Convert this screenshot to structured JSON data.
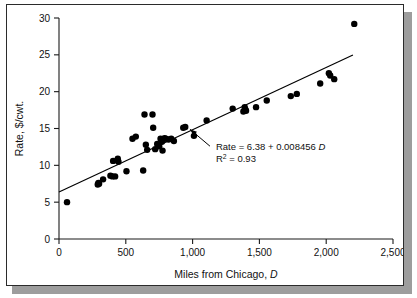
{
  "figure": {
    "caption_present": false,
    "background_color": "#ffffff",
    "border_color": "#2b2b2b",
    "shadow_color": "#9d9d9d"
  },
  "chart_data": {
    "type": "scatter",
    "title": "",
    "xlabel": "Miles from Chicago, D",
    "xlabel_plain": "Miles from Chicago,",
    "xlabel_symbol": "D",
    "ylabel": "Rate, $/cwt.",
    "xlim": [
      0,
      2500
    ],
    "ylim": [
      0,
      30
    ],
    "xticks": [
      0,
      500,
      1000,
      1500,
      2000,
      2500
    ],
    "xticklabels": [
      "0",
      "500",
      "1,000",
      "1,500",
      "2,000",
      "2,500"
    ],
    "yticks": [
      0,
      5,
      10,
      15,
      20,
      25,
      30
    ],
    "yticklabels": [
      "0",
      "5",
      "10",
      "15",
      "20",
      "25",
      "30"
    ],
    "grid": false,
    "legend": null,
    "marker_color": "#000000",
    "marker_size": 3.2,
    "series": [
      {
        "name": "Freight rate observations",
        "points": [
          [
            60,
            5.0
          ],
          [
            290,
            7.4
          ],
          [
            295,
            7.6
          ],
          [
            300,
            7.5
          ],
          [
            330,
            8.1
          ],
          [
            385,
            8.6
          ],
          [
            400,
            8.5
          ],
          [
            405,
            10.6
          ],
          [
            420,
            8.5
          ],
          [
            440,
            10.9
          ],
          [
            445,
            10.5
          ],
          [
            505,
            9.2
          ],
          [
            550,
            13.6
          ],
          [
            575,
            13.9
          ],
          [
            630,
            9.3
          ],
          [
            640,
            16.9
          ],
          [
            650,
            12.8
          ],
          [
            660,
            12.1
          ],
          [
            700,
            16.9
          ],
          [
            705,
            15.1
          ],
          [
            720,
            12.2
          ],
          [
            735,
            12.9
          ],
          [
            750,
            12.6
          ],
          [
            760,
            13.6
          ],
          [
            770,
            13.2
          ],
          [
            775,
            12.0
          ],
          [
            790,
            13.7
          ],
          [
            800,
            13.6
          ],
          [
            820,
            13.5
          ],
          [
            840,
            13.6
          ],
          [
            860,
            13.3
          ],
          [
            930,
            15.1
          ],
          [
            945,
            15.2
          ],
          [
            1010,
            14.0
          ],
          [
            1105,
            16.1
          ],
          [
            1300,
            17.7
          ],
          [
            1380,
            17.3
          ],
          [
            1390,
            17.9
          ],
          [
            1395,
            17.6
          ],
          [
            1400,
            17.4
          ],
          [
            1475,
            17.9
          ],
          [
            1555,
            18.8
          ],
          [
            1735,
            19.4
          ],
          [
            1780,
            19.7
          ],
          [
            1955,
            21.1
          ],
          [
            2020,
            22.5
          ],
          [
            2030,
            22.2
          ],
          [
            2060,
            21.7
          ],
          [
            2210,
            29.2
          ]
        ]
      }
    ],
    "fit_line": {
      "intercept": 6.38,
      "slope": 0.008456,
      "x_start": 0,
      "x_end": 2200,
      "equation_text": "Rate = 6.38 + 0.008456D",
      "equation_prefix": "Rate = 6.38 + 0.008456",
      "equation_symbol": "D",
      "r_squared_label": "R",
      "r_squared_exponent": "2",
      "r_squared_value": "= 0.93",
      "r_squared_text": "R2 = 0.93"
    },
    "annotation": {
      "line1": "Rate = 6.38 + 0.008456D",
      "line2": "R2 = 0.93",
      "arrow_from": [
        1130,
        12.6
      ],
      "arrow_to": [
        980,
        14.9
      ]
    }
  }
}
